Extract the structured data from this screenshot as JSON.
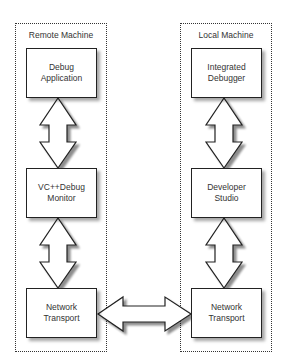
{
  "diagram": {
    "machines": [
      {
        "id": "remote",
        "title": "Remote Machine",
        "nodes": [
          {
            "line1": "Debug",
            "line2": "Application"
          },
          {
            "line1": "VC++Debug",
            "line2": "Monitor"
          },
          {
            "line1": "Network",
            "line2": "Transport"
          }
        ]
      },
      {
        "id": "local",
        "title": "Local Machine",
        "nodes": [
          {
            "line1": "Integrated",
            "line2": "Debugger"
          },
          {
            "line1": "Developer",
            "line2": "Studio"
          },
          {
            "line1": "Network",
            "line2": "Transport"
          }
        ]
      }
    ],
    "connections": [
      {
        "from": "Debug Application",
        "to": "VC++Debug Monitor",
        "type": "bidirectional"
      },
      {
        "from": "VC++Debug Monitor",
        "to": "Network Transport (Remote)",
        "type": "bidirectional"
      },
      {
        "from": "Integrated Debugger",
        "to": "Developer Studio",
        "type": "bidirectional"
      },
      {
        "from": "Developer Studio",
        "to": "Network Transport (Local)",
        "type": "bidirectional"
      },
      {
        "from": "Network Transport (Remote)",
        "to": "Network Transport (Local)",
        "type": "bidirectional"
      }
    ],
    "colors": {
      "stroke": "#222222",
      "fill": "#ffffff",
      "text": "#333333",
      "shadow": "#999999"
    }
  }
}
